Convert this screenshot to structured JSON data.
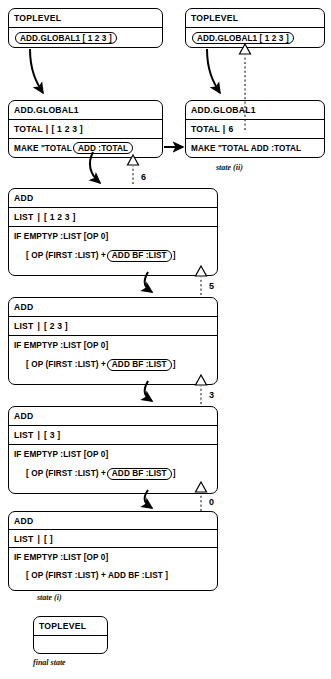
{
  "diagram": {
    "frames": [
      {
        "id": "toplevel-left",
        "title": "TOPLEVEL",
        "body_pre": "",
        "body_highlight": "ADD.GLOBAL1  [ 1  2  3 ]",
        "body_post": ""
      },
      {
        "id": "toplevel-right",
        "title": "TOPLEVEL",
        "body_pre": "",
        "body_highlight": "ADD.GLOBAL1 [ 1  2  3 ]",
        "body_post": ""
      },
      {
        "id": "addglobal1-left",
        "title": "ADD.GLOBAL1",
        "var_name": "TOTAL",
        "var_sep": "|",
        "var_value": "[ 1  2  3 ]",
        "body_pre": "MAKE  \"TOTAL",
        "body_highlight": "ADD :TOTAL",
        "body_post": ""
      },
      {
        "id": "addglobal1-right",
        "title": "ADD.GLOBAL1",
        "var_name": "TOTAL",
        "var_sep": "|",
        "var_value": "6",
        "body_pre": "MAKE  \"TOTAL ADD :TOTAL",
        "body_highlight": "",
        "body_post": ""
      },
      {
        "id": "add-1",
        "title": "ADD",
        "var_name": "LIST",
        "var_sep": "|",
        "var_value": "[ 1  2  3 ]",
        "line1": "IF EMPTYP :LIST [OP 0]",
        "line2_pre": "[ OP (FIRST :LIST)  +",
        "line2_highlight": "ADD BF :LIST",
        "line2_post": "]"
      },
      {
        "id": "add-2",
        "title": "ADD",
        "var_name": "LIST",
        "var_sep": "|",
        "var_value": "[ 2  3 ]",
        "line1": "IF EMPTYP :LIST [OP 0]",
        "line2_pre": "[ OP (FIRST :LIST)  +",
        "line2_highlight": "ADD BF :LIST",
        "line2_post": "]"
      },
      {
        "id": "add-3",
        "title": "ADD",
        "var_name": "LIST",
        "var_sep": "|",
        "var_value": "[ 3 ]",
        "line1": "IF EMPTYP :LIST [OP 0]",
        "line2_pre": "[ OP (FIRST :LIST)  +",
        "line2_highlight": "ADD BF :LIST",
        "line2_post": "]"
      },
      {
        "id": "add-4",
        "title": "ADD",
        "var_name": "LIST",
        "var_sep": "|",
        "var_value": "[ ]",
        "line1": "IF EMPTYP :LIST [OP 0]",
        "line2_pre": "[ OP (FIRST :LIST)  +  ADD BF :LIST  ]",
        "line2_highlight": "",
        "line2_post": ""
      },
      {
        "id": "toplevel-final",
        "title": "TOPLEVEL",
        "body_pre": "",
        "body_highlight": "",
        "body_post": ""
      }
    ],
    "return_values": [
      {
        "id": "ret-6",
        "label": "6"
      },
      {
        "id": "ret-5",
        "label": "5"
      },
      {
        "id": "ret-3",
        "label": "3"
      },
      {
        "id": "ret-0",
        "label": "0"
      }
    ],
    "captions": [
      {
        "id": "caption-state-ii",
        "text": "state (ii)"
      },
      {
        "id": "caption-state-i",
        "text": "state (i)"
      },
      {
        "id": "caption-final-state",
        "text": "final state"
      }
    ],
    "colors": {
      "stroke": "#000000",
      "background": "#ffffff"
    }
  }
}
